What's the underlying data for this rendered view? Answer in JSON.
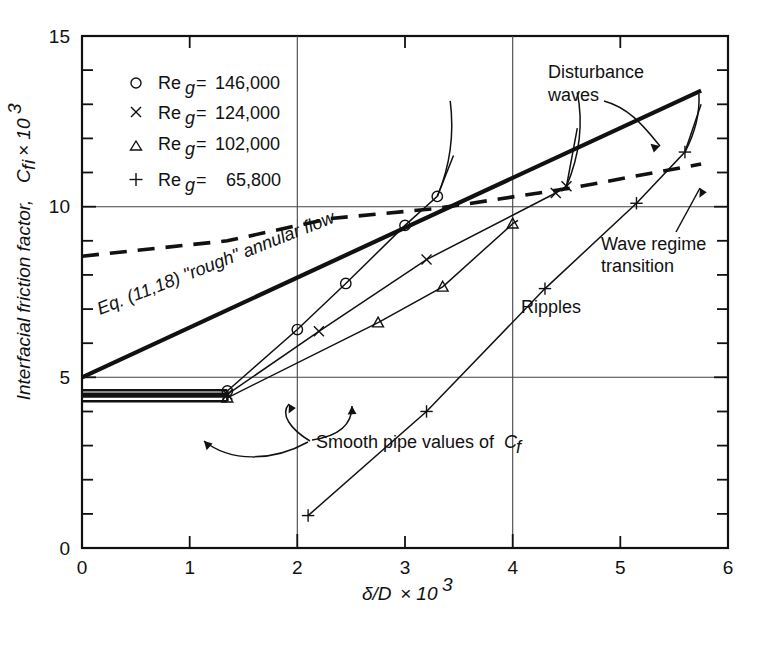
{
  "figure": {
    "background": "#ffffff",
    "ink": "#111111"
  },
  "axes": {
    "y_title": "Interfacial friction factor,",
    "y_title_sym": "C",
    "y_title_sub": "f",
    "y_title_sub2": "i",
    "y_title_tail": "× 10",
    "y_title_exp": "3",
    "x_title_sym": "δ/D",
    "x_title_tail": "× 10",
    "x_title_exp": "3",
    "x_ticklabels": [
      "0",
      "1",
      "2",
      "3",
      "4",
      "5",
      "6"
    ],
    "y_ticklabels": [
      "0",
      "5",
      "10",
      "15"
    ]
  },
  "legend": {
    "items": [
      {
        "marker": "circle-marker",
        "symbol": "○",
        "label_sym": "Re",
        "label_sub": "g",
        "label_eq": "=",
        "value": "146,000"
      },
      {
        "marker": "cross-marker",
        "symbol": "×",
        "label_sym": "Re",
        "label_sub": "g",
        "label_eq": "=",
        "value": "124,000"
      },
      {
        "marker": "triangle-marker",
        "symbol": "△",
        "label_sym": "Re",
        "label_sub": "g",
        "label_eq": "=",
        "value": "102,000"
      },
      {
        "marker": "plus-marker",
        "symbol": "+",
        "label_sym": "Re",
        "label_sub": "g",
        "label_eq": "=",
        "value": "65,800"
      }
    ]
  },
  "annotations": {
    "eq_label": "Eq. (11,18)  \"rough\"  annular flow",
    "disturbance_waves_line1": "Disturbance",
    "disturbance_waves_line2": "waves",
    "wave_regime_line1": "Wave regime",
    "wave_regime_line2": "transition",
    "ripples": "Ripples",
    "smooth_pipe_text": "Smooth pipe values of",
    "smooth_pipe_sym": "C",
    "smooth_pipe_sub": "f"
  },
  "chart_data": {
    "type": "line",
    "title": "",
    "xlabel": "δ/D × 10³",
    "ylabel": "Interfacial friction factor, C_fi × 10³",
    "xlim": [
      0,
      6
    ],
    "ylim": [
      0,
      15
    ],
    "xticks": [
      0,
      1,
      2,
      3,
      4,
      5,
      6
    ],
    "yticks": [
      0,
      5,
      10,
      15
    ],
    "yminorticks": [
      1,
      2,
      3,
      4,
      6,
      7,
      8,
      9,
      11,
      12,
      13,
      14
    ],
    "grid": "major-partial",
    "legend_position": "upper-left-inside",
    "series": [
      {
        "name": "Eq. (11,18) \"rough\" annular flow",
        "style": "thick-solid",
        "marker": "none",
        "x": [
          0.0,
          5.75
        ],
        "y": [
          5.0,
          13.4
        ]
      },
      {
        "name": "Wave regime transition",
        "style": "dashed",
        "marker": "none",
        "x": [
          0.0,
          1.35,
          2.3,
          3.3,
          4.55,
          5.75
        ],
        "y": [
          8.55,
          9.0,
          9.65,
          9.95,
          10.55,
          11.25
        ]
      },
      {
        "name": "Re_g = 146,000",
        "marker": "circle",
        "x": [
          1.35,
          2.0,
          2.45,
          3.0,
          3.3
        ],
        "y": [
          4.6,
          6.4,
          7.75,
          9.45,
          10.3
        ],
        "extends_to": {
          "x": 3.45,
          "y": 11.5
        }
      },
      {
        "name": "Re_g = 124,000",
        "marker": "cross",
        "x": [
          1.35,
          2.2,
          3.2,
          4.4,
          4.5
        ],
        "y": [
          4.5,
          6.35,
          8.45,
          10.4,
          10.6
        ],
        "extends_to": {
          "x": 4.6,
          "y": 12.3
        }
      },
      {
        "name": "Re_g = 102,000",
        "marker": "triangle",
        "x": [
          1.35,
          2.75,
          3.35,
          4.0
        ],
        "y": [
          4.4,
          6.6,
          7.65,
          9.5
        ],
        "extends_to": {
          "x": 4.05,
          "y": 9.6
        }
      },
      {
        "name": "Re_g = 65,800",
        "marker": "plus",
        "x": [
          2.1,
          3.2,
          4.3,
          5.15,
          5.6
        ],
        "y": [
          0.95,
          4.0,
          7.6,
          10.1,
          11.6
        ],
        "extends_to": {
          "x": 5.75,
          "y": 13.0
        }
      },
      {
        "name": "Smooth pipe values of C_f",
        "style": "flat-bundle",
        "marker": "none",
        "x": [
          0.0,
          1.35
        ],
        "y": [
          4.6,
          4.6
        ],
        "bundle_values": [
          4.62,
          4.52,
          4.44,
          4.3
        ]
      }
    ]
  }
}
